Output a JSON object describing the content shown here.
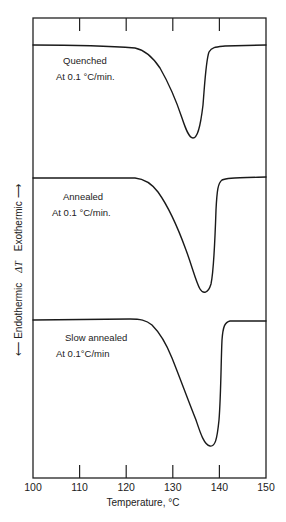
{
  "chart_data": {
    "type": "line",
    "title": "",
    "xlabel": "Temperature, °C",
    "ylabel": "← Endothermic   ΔT   Exothermic →",
    "ylabel_parts": {
      "left": "⟵ Endothermic",
      "middle": "ΔT",
      "right": "Exothermic ⟶"
    },
    "xlim": [
      100,
      150
    ],
    "xticks": [
      100,
      110,
      120,
      130,
      140,
      150
    ],
    "xtick_labels": [
      "100",
      "110",
      "120",
      "130",
      "140",
      "150"
    ],
    "grid": false,
    "legend": "none (curves labeled inline)",
    "series": [
      {
        "name": "Quenched",
        "annotation": [
          "Quenched",
          "At 0.1 °C/min."
        ],
        "peak_temperature": 133.5,
        "points": [
          [
            100,
            0.0
          ],
          [
            110,
            -0.05
          ],
          [
            120,
            -0.12
          ],
          [
            124,
            -0.2
          ],
          [
            126,
            -0.5
          ],
          [
            128,
            -1.3
          ],
          [
            130,
            -2.6
          ],
          [
            131.5,
            -3.6
          ],
          [
            132.5,
            -4.3
          ],
          [
            133.5,
            -4.6
          ],
          [
            134.5,
            -4.2
          ],
          [
            135.2,
            -3.0
          ],
          [
            135.8,
            -1.4
          ],
          [
            136.3,
            -0.4
          ],
          [
            137,
            -0.08
          ],
          [
            140,
            -0.04
          ],
          [
            150,
            0.0
          ]
        ]
      },
      {
        "name": "Annealed",
        "annotation": [
          "Annealed",
          "At 0.1 °C/min."
        ],
        "peak_temperature": 136.5,
        "points": [
          [
            100,
            0.0
          ],
          [
            110,
            0.0
          ],
          [
            120,
            -0.02
          ],
          [
            123,
            -0.15
          ],
          [
            126,
            -0.6
          ],
          [
            129,
            -1.5
          ],
          [
            132,
            -2.8
          ],
          [
            134,
            -3.9
          ],
          [
            135.5,
            -5.0
          ],
          [
            136.5,
            -5.6
          ],
          [
            137.4,
            -5.1
          ],
          [
            138,
            -3.4
          ],
          [
            138.5,
            -1.4
          ],
          [
            139,
            -0.3
          ],
          [
            140,
            -0.05
          ],
          [
            145,
            0.0
          ],
          [
            150,
            0.05
          ]
        ]
      },
      {
        "name": "Slow annealed",
        "annotation": [
          "Slow annealed",
          "At 0.1°C/min"
        ],
        "peak_temperature": 138,
        "points": [
          [
            100,
            0.0
          ],
          [
            110,
            0.0
          ],
          [
            120,
            0.05
          ],
          [
            124,
            0.05
          ],
          [
            126,
            -0.2
          ],
          [
            128,
            -0.7
          ],
          [
            130,
            -1.5
          ],
          [
            132,
            -2.6
          ],
          [
            134,
            -3.8
          ],
          [
            136,
            -5.2
          ],
          [
            137.2,
            -6.2
          ],
          [
            138,
            -6.4
          ],
          [
            138.8,
            -5.8
          ],
          [
            139.3,
            -3.8
          ],
          [
            139.7,
            -1.5
          ],
          [
            140.2,
            -0.3
          ],
          [
            141,
            -0.05
          ],
          [
            145,
            0.0
          ],
          [
            150,
            0.0
          ]
        ]
      }
    ]
  },
  "labels": {
    "quenched": "Quenched",
    "quenched_rate": "At 0.1 °C/min.",
    "annealed": "Annealed",
    "annealed_rate": "At 0.1 °C/min.",
    "slow": "Slow annealed",
    "slow_rate": "At 0.1°C/min",
    "xlabel": "Temperature, °C",
    "y_left": "⟵ Endothermic",
    "y_mid": "ΔT",
    "y_right": "Exothermic ⟶"
  }
}
